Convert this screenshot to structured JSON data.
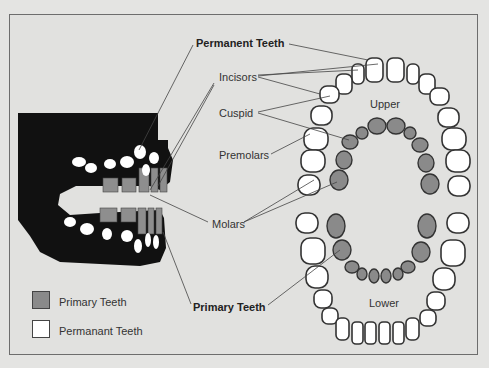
{
  "labels": {
    "permanent_teeth": "Permanent Teeth",
    "incisors": "Incisors",
    "cuspid": "Cuspid",
    "premolars": "Premolars",
    "molars": "Molars",
    "primary_teeth": "Primary Teeth",
    "upper": "Upper",
    "lower": "Lower"
  },
  "legend": [
    {
      "label": "Primary Teeth",
      "color": "#8a8a8a"
    },
    {
      "label": "Permanant Teeth",
      "color": "#ffffff"
    }
  ],
  "colors": {
    "background": "#e1e1df",
    "primary_tooth": "#8a8a8a",
    "permanent_tooth": "#ffffff",
    "jaw": "#111111",
    "outline": "#333333"
  }
}
